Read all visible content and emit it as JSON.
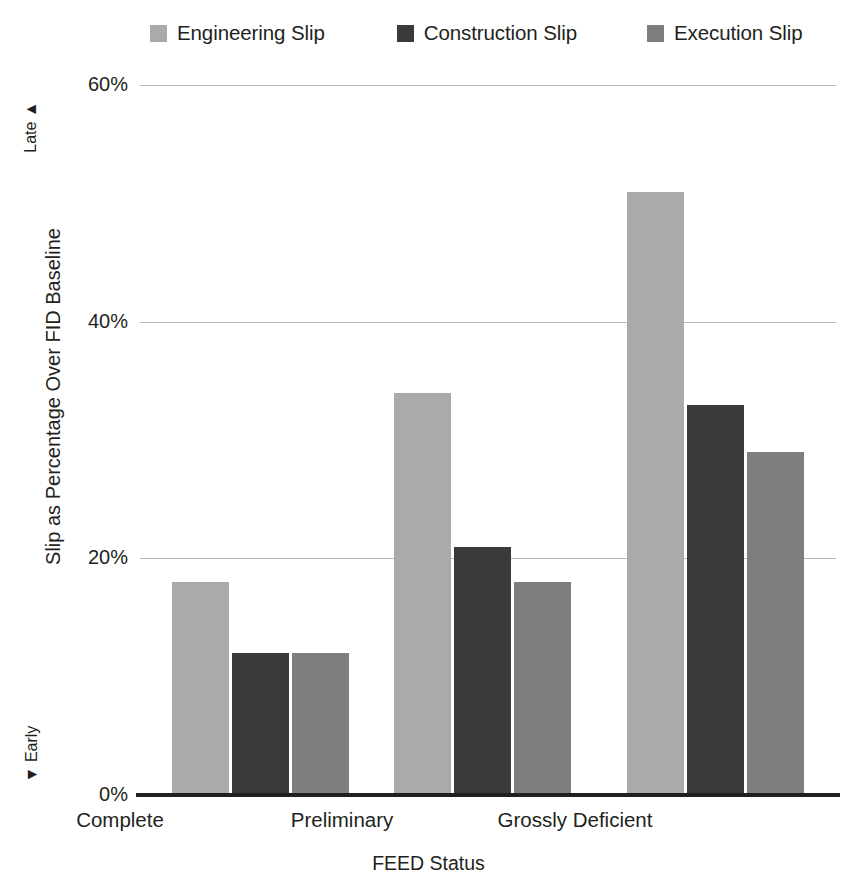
{
  "chart_data": {
    "type": "bar",
    "title": "",
    "xlabel": "FEED Status",
    "ylabel": "Slip as Percentage Over FID Baseline",
    "categories": [
      "Complete",
      "Preliminary",
      "Grossly Deficient"
    ],
    "series": [
      {
        "name": "Engineering Slip",
        "color": "#aaaaaa",
        "values": [
          18,
          34,
          51
        ]
      },
      {
        "name": "Construction Slip",
        "color": "#3a3a3a",
        "values": [
          12,
          21,
          33
        ]
      },
      {
        "name": "Execution Slip",
        "color": "#7e7e7e",
        "values": [
          12,
          18,
          29
        ]
      }
    ],
    "ylim": [
      0,
      60
    ],
    "yticks": [
      0,
      20,
      40,
      60
    ],
    "ytick_labels": [
      "0%",
      "20%",
      "40%",
      "60%"
    ],
    "grid": true,
    "legend_position": "top",
    "axis_direction_labels": {
      "top": "Late",
      "top_arrow": "▲",
      "bottom": "Early",
      "bottom_arrow": "▼"
    }
  },
  "legend": {
    "items": [
      {
        "label": "Engineering Slip"
      },
      {
        "label": "Construction Slip"
      },
      {
        "label": "Execution Slip"
      }
    ]
  },
  "axes": {
    "y_title": "Slip as Percentage Over FID Baseline",
    "x_title": "FEED Status",
    "late": "Late ▲",
    "early": "▼ Early",
    "yticks": [
      "60%",
      "40%",
      "20%",
      "0%"
    ],
    "xticks": [
      "Complete",
      "Preliminary",
      "Grossly Deficient"
    ]
  }
}
